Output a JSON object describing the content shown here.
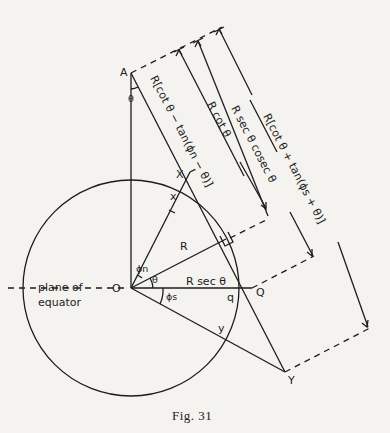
{
  "figure": {
    "caption": "Fig. 31",
    "points": {
      "A": "A",
      "O": "O",
      "X": "X",
      "x": "x",
      "Q": "Q",
      "q": "q",
      "Y": "Y",
      "y": "y"
    },
    "angles": {
      "theta_at_A": "θ",
      "theta_at_O": "θ",
      "phi_n": "ϕn",
      "phi_s": "ϕs"
    },
    "segment_labels": {
      "radius": "R",
      "OQ": "R sec θ"
    },
    "plane_label": {
      "line1": "plane of",
      "line2": "equator"
    },
    "dimension_labels": [
      "R[cot θ − tan(ϕn − θ)]",
      "R cot θ",
      "R sec θ cosec θ",
      "R[cot θ + tan(ϕs + θ)]"
    ]
  }
}
